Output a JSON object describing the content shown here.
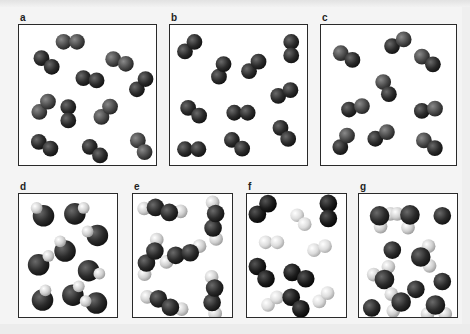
{
  "figure": {
    "colors": {
      "dark_atom": "#2a2a2a",
      "medium_atom": "#555555",
      "light_atom": "#d8d8d8",
      "white_atom": "#eeeeee",
      "box_border": "#2a2a2a",
      "box_fill": "#ffffff"
    },
    "panels": [
      {
        "label": "a",
        "x": 18,
        "y": 24,
        "w": 139,
        "h": 142,
        "content": "homonuclear diatomic molecules, medium gray",
        "molecules": [
          {
            "type": "diatomic",
            "cx": 52,
            "cy": 17,
            "angle": 0,
            "a1": "medium",
            "a2": "medium"
          },
          {
            "type": "diatomic",
            "cx": 28,
            "cy": 38,
            "angle": 40,
            "a1": "dark",
            "a2": "dark"
          },
          {
            "type": "diatomic",
            "cx": 102,
            "cy": 37,
            "angle": 20,
            "a1": "medium",
            "a2": "medium"
          },
          {
            "type": "diatomic",
            "cx": 72,
            "cy": 55,
            "angle": 10,
            "a1": "dark",
            "a2": "dark"
          },
          {
            "type": "diatomic",
            "cx": 124,
            "cy": 60,
            "angle": -50,
            "a1": "dark",
            "a2": "dark"
          },
          {
            "type": "diatomic",
            "cx": 25,
            "cy": 83,
            "angle": -50,
            "a1": "medium",
            "a2": "medium"
          },
          {
            "type": "diatomic",
            "cx": 50,
            "cy": 90,
            "angle": 90,
            "a1": "dark",
            "a2": "dark"
          },
          {
            "type": "diatomic",
            "cx": 88,
            "cy": 88,
            "angle": -50,
            "a1": "medium",
            "a2": "medium"
          },
          {
            "type": "diatomic",
            "cx": 26,
            "cy": 122,
            "angle": 30,
            "a1": "dark",
            "a2": "dark"
          },
          {
            "type": "diatomic",
            "cx": 77,
            "cy": 128,
            "angle": 40,
            "a1": "dark",
            "a2": "dark"
          },
          {
            "type": "diatomic",
            "cx": 124,
            "cy": 123,
            "angle": 60,
            "a1": "medium",
            "a2": "medium"
          }
        ]
      },
      {
        "label": "b",
        "x": 169,
        "y": 24,
        "w": 139,
        "h": 142,
        "content": "homonuclear diatomic molecules, dark",
        "molecules": [
          {
            "type": "diatomic",
            "cx": 20,
            "cy": 22,
            "angle": -45,
            "a1": "dark",
            "a2": "dark"
          },
          {
            "type": "diatomic",
            "cx": 123,
            "cy": 24,
            "angle": 90,
            "a1": "dark",
            "a2": "dark"
          },
          {
            "type": "diatomic",
            "cx": 52,
            "cy": 46,
            "angle": -70,
            "a1": "dark",
            "a2": "dark"
          },
          {
            "type": "diatomic",
            "cx": 85,
            "cy": 42,
            "angle": -45,
            "a1": "dark",
            "a2": "dark"
          },
          {
            "type": "diatomic",
            "cx": 116,
            "cy": 69,
            "angle": -25,
            "a1": "dark",
            "a2": "dark"
          },
          {
            "type": "diatomic",
            "cx": 24,
            "cy": 88,
            "angle": 35,
            "a1": "dark",
            "a2": "dark"
          },
          {
            "type": "diatomic",
            "cx": 72,
            "cy": 89,
            "angle": 0,
            "a1": "dark",
            "a2": "dark"
          },
          {
            "type": "diatomic",
            "cx": 116,
            "cy": 110,
            "angle": 55,
            "a1": "dark",
            "a2": "dark"
          },
          {
            "type": "diatomic",
            "cx": 22,
            "cy": 126,
            "angle": 0,
            "a1": "dark",
            "a2": "dark"
          },
          {
            "type": "diatomic",
            "cx": 68,
            "cy": 121,
            "angle": 40,
            "a1": "dark",
            "a2": "dark"
          }
        ]
      },
      {
        "label": "c",
        "x": 320,
        "y": 24,
        "w": 137,
        "h": 142,
        "content": "heteronuclear diatomic molecules, medium + dark atoms",
        "molecules": [
          {
            "type": "diatomic",
            "cx": 26,
            "cy": 32,
            "angle": 30,
            "a1": "medium",
            "a2": "dark"
          },
          {
            "type": "diatomic",
            "cx": 78,
            "cy": 18,
            "angle": -30,
            "a1": "dark",
            "a2": "medium"
          },
          {
            "type": "diatomic",
            "cx": 108,
            "cy": 36,
            "angle": 35,
            "a1": "medium",
            "a2": "dark"
          },
          {
            "type": "diatomic",
            "cx": 66,
            "cy": 64,
            "angle": 65,
            "a1": "medium",
            "a2": "dark"
          },
          {
            "type": "diatomic",
            "cx": 35,
            "cy": 84,
            "angle": -15,
            "a1": "dark",
            "a2": "medium"
          },
          {
            "type": "diatomic",
            "cx": 109,
            "cy": 86,
            "angle": -10,
            "a1": "dark",
            "a2": "medium"
          },
          {
            "type": "diatomic",
            "cx": 23,
            "cy": 118,
            "angle": -60,
            "a1": "dark",
            "a2": "medium"
          },
          {
            "type": "diatomic",
            "cx": 61,
            "cy": 112,
            "angle": -30,
            "a1": "dark",
            "a2": "medium"
          },
          {
            "type": "diatomic",
            "cx": 110,
            "cy": 121,
            "angle": 35,
            "a1": "medium",
            "a2": "dark"
          }
        ]
      },
      {
        "label": "d",
        "x": 18,
        "y": 193,
        "w": 100,
        "h": 125,
        "content": "large dark atom bonded to small light atom",
        "molecules": [
          {
            "type": "bigsmall",
            "cx": 25,
            "cy": 22,
            "sx": 18,
            "sy": 14
          },
          {
            "type": "bigsmall",
            "cx": 57,
            "cy": 20,
            "sx": 66,
            "sy": 14
          },
          {
            "type": "bigsmall",
            "cx": 80,
            "cy": 42,
            "sx": 70,
            "sy": 38
          },
          {
            "type": "bigsmall",
            "cx": 47,
            "cy": 58,
            "sx": 42,
            "sy": 48
          },
          {
            "type": "bigsmall",
            "cx": 20,
            "cy": 72,
            "sx": 30,
            "sy": 63
          },
          {
            "type": "bigsmall",
            "cx": 71,
            "cy": 78,
            "sx": 82,
            "sy": 81
          },
          {
            "type": "bigsmall",
            "cx": 24,
            "cy": 108,
            "sx": 27,
            "sy": 98
          },
          {
            "type": "bigsmall",
            "cx": 55,
            "cy": 103,
            "sx": 61,
            "sy": 94
          },
          {
            "type": "bigsmall",
            "cx": 79,
            "cy": 111,
            "sx": 68,
            "sy": 109
          }
        ]
      },
      {
        "label": "e",
        "x": 132,
        "y": 193,
        "w": 101,
        "h": 125,
        "content": "X2Y2 molecules: two dark central atoms with light end atoms",
        "molecules": [
          {
            "type": "tetra",
            "cx": 30,
            "cy": 16,
            "angle": 20
          },
          {
            "type": "tetra",
            "cx": 83,
            "cy": 27,
            "angle": -80
          },
          {
            "type": "tetra",
            "cx": 18,
            "cy": 64,
            "angle": -55
          },
          {
            "type": "tetra",
            "cx": 51,
            "cy": 61,
            "angle": -10
          },
          {
            "type": "tetra",
            "cx": 32,
            "cy": 111,
            "angle": 35
          },
          {
            "type": "tetra",
            "cx": 82,
            "cy": 103,
            "angle": -80
          }
        ]
      },
      {
        "label": "f",
        "x": 246,
        "y": 193,
        "w": 101,
        "h": 125,
        "content": "mixture of dark diatomic and light diatomic molecules",
        "molecules": [
          {
            "type": "diatomic",
            "cx": 16,
            "cy": 15,
            "angle": -45,
            "a1": "black",
            "a2": "black",
            "r": 9
          },
          {
            "type": "diatomic",
            "cx": 55,
            "cy": 26,
            "angle": 50,
            "a1": "white",
            "a2": "white",
            "r": 7
          },
          {
            "type": "diatomic",
            "cx": 83,
            "cy": 17,
            "angle": 90,
            "a1": "black",
            "a2": "black",
            "r": 9
          },
          {
            "type": "diatomic",
            "cx": 25,
            "cy": 49,
            "angle": 0,
            "a1": "white",
            "a2": "white",
            "r": 7
          },
          {
            "type": "diatomic",
            "cx": 74,
            "cy": 55,
            "angle": -20,
            "a1": "white",
            "a2": "white",
            "r": 7
          },
          {
            "type": "diatomic",
            "cx": 15,
            "cy": 80,
            "angle": 55,
            "a1": "black",
            "a2": "black",
            "r": 9
          },
          {
            "type": "diatomic",
            "cx": 53,
            "cy": 83,
            "angle": 25,
            "a1": "black",
            "a2": "black",
            "r": 9
          },
          {
            "type": "diatomic",
            "cx": 26,
            "cy": 109,
            "angle": -40,
            "a1": "white",
            "a2": "white",
            "r": 7
          },
          {
            "type": "diatomic",
            "cx": 50,
            "cy": 111,
            "angle": 50,
            "a1": "black",
            "a2": "black",
            "r": 9
          },
          {
            "type": "diatomic",
            "cx": 78,
            "cy": 105,
            "angle": -45,
            "a1": "white",
            "a2": "white",
            "r": 7
          }
        ]
      },
      {
        "label": "g",
        "x": 358,
        "y": 193,
        "w": 100,
        "h": 125,
        "content": "mixture of dark single atoms and XY2 molecules",
        "molecules": [
          {
            "type": "tri",
            "cx": 21,
            "cy": 22,
            "s1x": 32,
            "s1y": 20,
            "s2x": 22,
            "s2y": 33
          },
          {
            "type": "tri",
            "cx": 52,
            "cy": 21,
            "s1x": 39,
            "s1y": 20,
            "s2x": 50,
            "s2y": 34
          },
          {
            "type": "atom",
            "cx": 85,
            "cy": 22,
            "r": 9
          },
          {
            "type": "atom",
            "cx": 34,
            "cy": 57,
            "r": 9
          },
          {
            "type": "tri",
            "cx": 63,
            "cy": 64,
            "s1x": 71,
            "s1y": 53,
            "s2x": 72,
            "s2y": 73
          },
          {
            "type": "tri",
            "cx": 26,
            "cy": 87,
            "s1x": 15,
            "s1y": 82,
            "s2x": 30,
            "s2y": 74
          },
          {
            "type": "atom",
            "cx": 58,
            "cy": 97,
            "r": 9
          },
          {
            "type": "atom",
            "cx": 85,
            "cy": 89,
            "r": 9
          },
          {
            "type": "atom",
            "cx": 13,
            "cy": 116,
            "r": 9
          },
          {
            "type": "tri",
            "cx": 43,
            "cy": 110,
            "s1x": 33,
            "s1y": 102,
            "s2x": 35,
            "s2y": 119
          },
          {
            "type": "tri",
            "cx": 78,
            "cy": 113,
            "s1x": 70,
            "s1y": 122,
            "s2x": 88,
            "s2y": 122
          }
        ]
      }
    ]
  }
}
